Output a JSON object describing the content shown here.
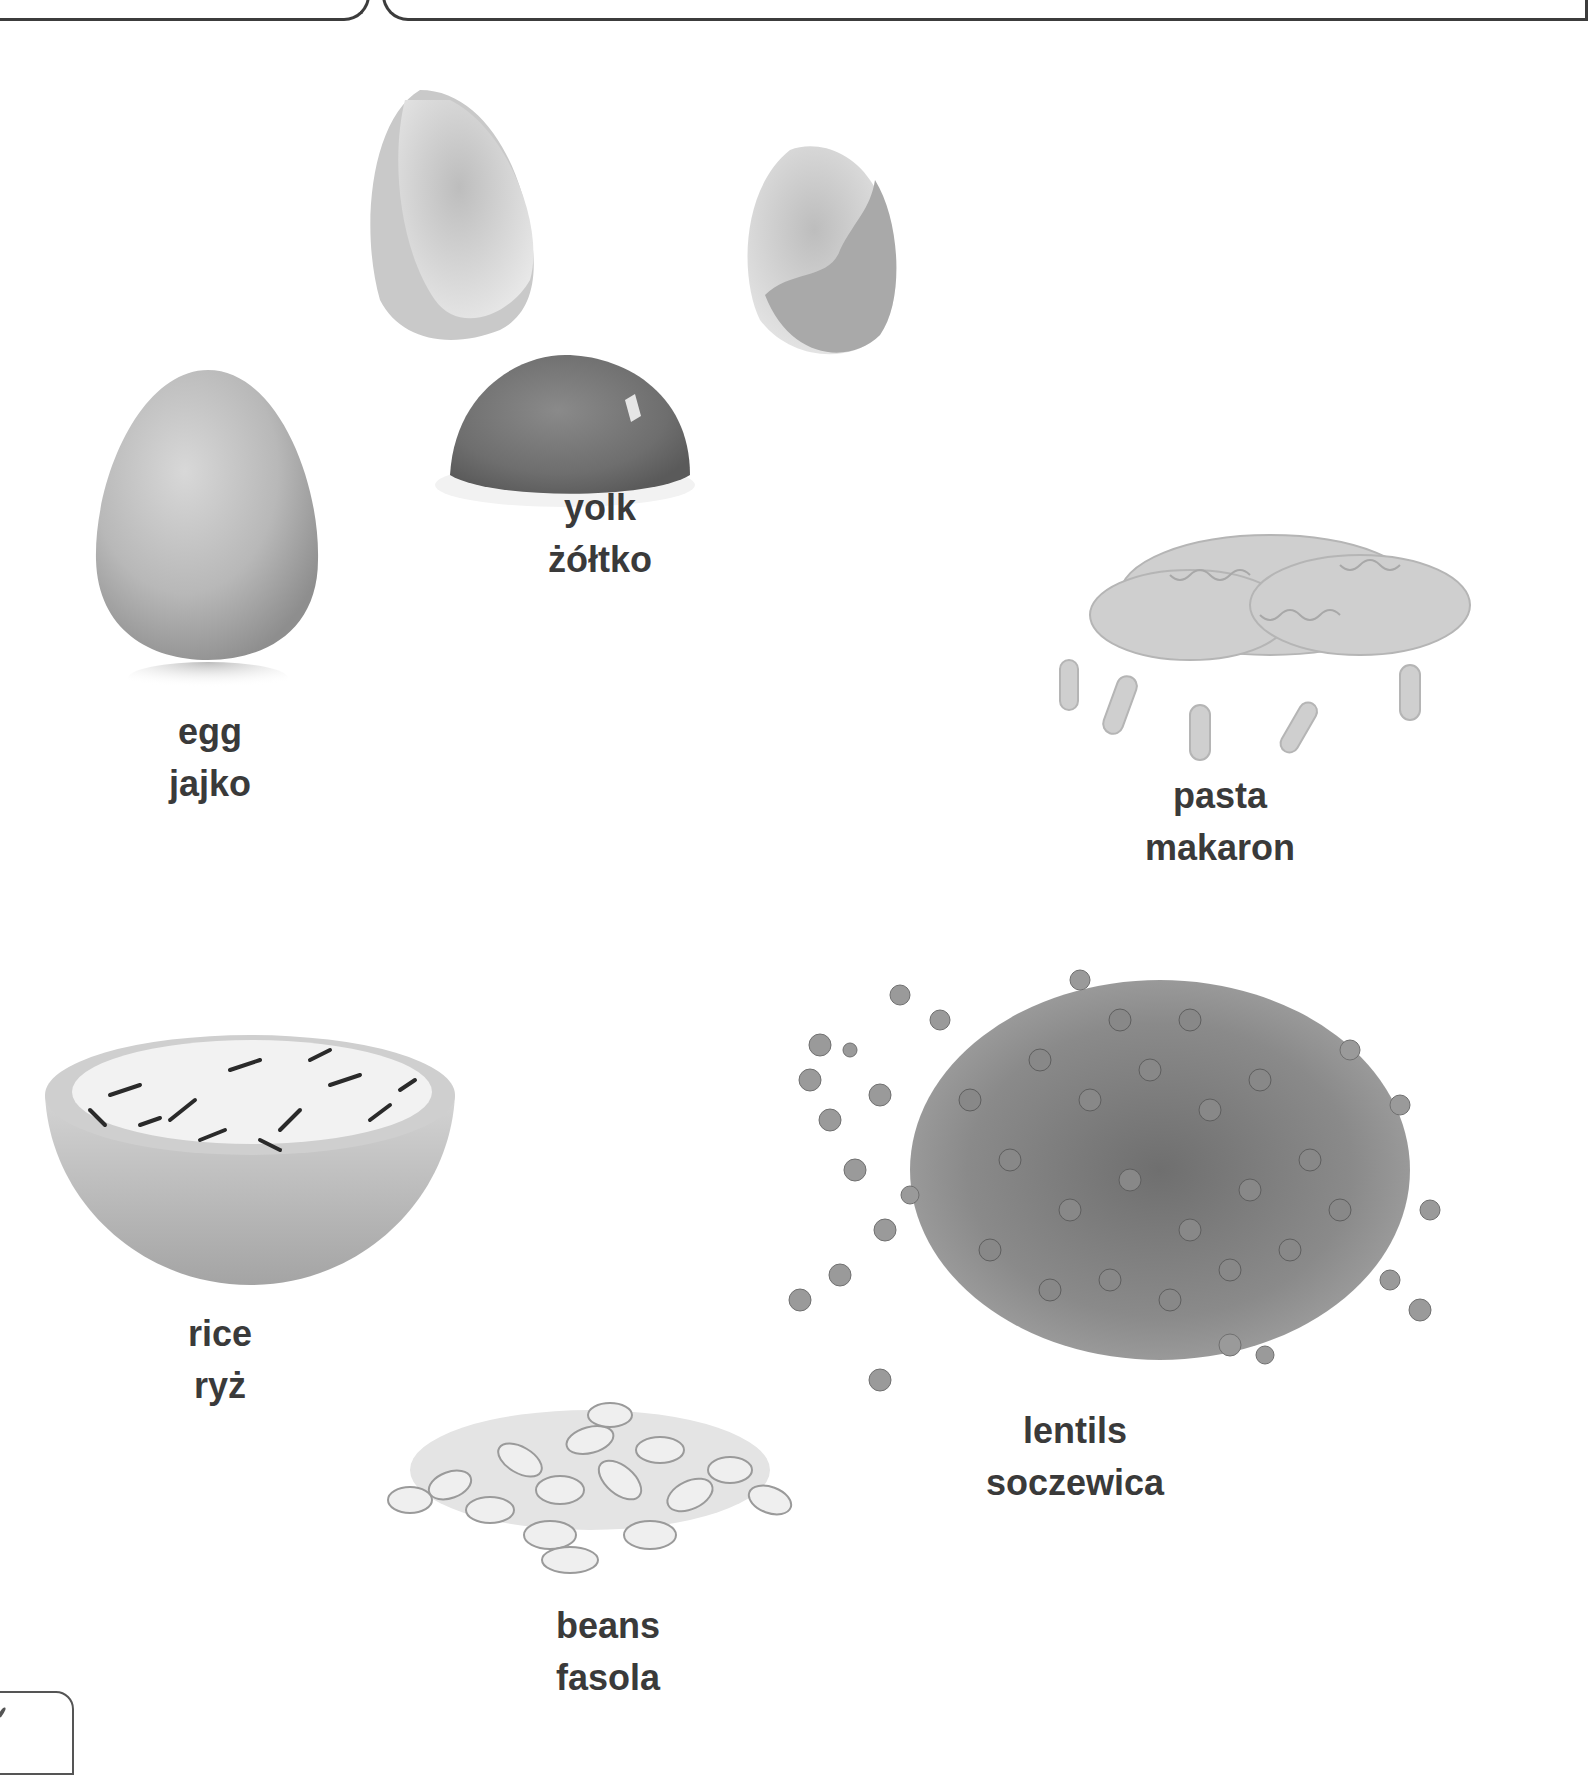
{
  "page": {
    "type": "picture-dictionary",
    "languages": [
      "English",
      "Polish"
    ],
    "text_color": "#3a3a3a",
    "background": "#ffffff"
  },
  "items": {
    "egg": {
      "en": "egg",
      "pl": "jajko",
      "image": "egg-image"
    },
    "yolk": {
      "en": "yolk",
      "pl": "żółtko",
      "image": "yolk-and-shells-image"
    },
    "pasta": {
      "en": "pasta",
      "pl": "makaron",
      "image": "fusilli-pasta-image"
    },
    "rice": {
      "en": "rice",
      "pl": "ryż",
      "image": "rice-bowl-image"
    },
    "beans": {
      "en": "beans",
      "pl": "fasola",
      "image": "white-beans-image"
    },
    "lentils": {
      "en": "lentils",
      "pl": "soczewica",
      "image": "lentils-pile-image"
    }
  }
}
